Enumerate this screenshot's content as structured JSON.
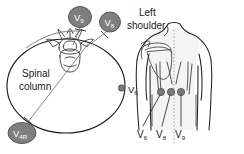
{
  "figure": {
    "title_semantic": "posterior-chest-lead-placement-diagram",
    "colors": {
      "electrode_badge_fill": "#7f7f7f",
      "electrode_badge_stroke": "#4d4d4d",
      "electrode_dot_fill": "#7a7a7a",
      "outline": "#1a1a1a",
      "body_outline": "#222222",
      "body_shade": "#f2f2f2",
      "leader_line": "#555555",
      "spine_dotted": "#9a9a9a",
      "text": "#1a1a1a",
      "badge_text": "#ffffff",
      "background": "#ffffff"
    },
    "left_panel": {
      "name": "transverse-cross-section",
      "labels": {
        "spinal_column_line1": "Spinal",
        "spinal_column_line2": "column",
        "v6_side_label_base": "V",
        "v6_side_label_sub": "6"
      },
      "badges": [
        {
          "name": "badge-v9",
          "base": "V",
          "sub": "9",
          "cx": 80,
          "cy": 17,
          "rx": 11.5,
          "ry": 10.5
        },
        {
          "name": "badge-v8",
          "base": "V",
          "sub": "8",
          "cx": 110,
          "cy": 22,
          "rx": 10.5,
          "ry": 10
        },
        {
          "name": "badge-v4r",
          "base": "V",
          "sub": "4R",
          "cx": 22,
          "cy": 133,
          "rx": 14,
          "ry": 10.5
        }
      ]
    },
    "right_panel": {
      "name": "posterior-torso-view",
      "labels": {
        "left_shoulder_line1": "Left",
        "left_shoulder_line2": "shoulder"
      },
      "electrodes": [
        {
          "name": "electrode-dot-v6",
          "cx": 161,
          "cy": 92,
          "r": 3.6
        },
        {
          "name": "electrode-dot-v8",
          "cx": 171,
          "cy": 92,
          "r": 3.6
        },
        {
          "name": "electrode-dot-v9",
          "cx": 181,
          "cy": 92,
          "r": 3.6
        }
      ],
      "bottom_labels": [
        {
          "name": "label-v6",
          "base": "V",
          "sub": "6",
          "x": 137
        },
        {
          "name": "label-v8",
          "base": "V",
          "sub": "8",
          "x": 156
        },
        {
          "name": "label-v9",
          "base": "V",
          "sub": "9",
          "x": 175
        }
      ]
    }
  }
}
